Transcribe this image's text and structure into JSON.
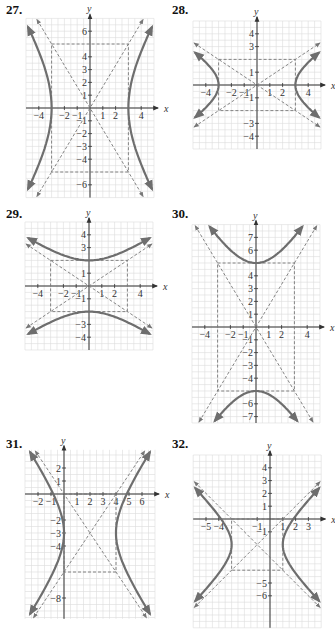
{
  "chart_data": [
    {
      "type": "line",
      "problem": "27.",
      "title": "Hyperbola (horizontal transverse axis)",
      "xlabel": "x",
      "ylabel": "y",
      "center": [
        0,
        0
      ],
      "a": 3,
      "b": 5,
      "orientation": "horizontal",
      "vertices": [
        [
          -3,
          0
        ],
        [
          3,
          0
        ]
      ],
      "asymptotes": [
        "y = 5/3 x",
        "y = -5/3 x"
      ],
      "xlim": [
        -5,
        5
      ],
      "ylim": [
        -7,
        7
      ],
      "xticks": [
        "-4",
        "-2",
        "-1",
        "1",
        "2",
        "4"
      ],
      "yticks": [
        "6",
        "4",
        "3",
        "2",
        "1",
        "-1",
        "-2",
        "-3",
        "-4",
        "-6"
      ],
      "grid": true,
      "frame": {
        "x": 25,
        "y": 20,
        "origin": [
          90,
          108
        ],
        "unit": 12.8,
        "xmin": -5,
        "xmax": 5,
        "ymin": -7,
        "ymax": 7
      }
    },
    {
      "type": "line",
      "problem": "28.",
      "title": "Hyperbola (horizontal transverse axis)",
      "xlabel": "x",
      "ylabel": "y",
      "center": [
        0,
        0
      ],
      "a": 3,
      "b": 2,
      "orientation": "horizontal",
      "vertices": [
        [
          -3,
          0
        ],
        [
          3,
          0
        ]
      ],
      "asymptotes": [
        "y = 2/3 x",
        "y = -2/3 x"
      ],
      "xlim": [
        -5,
        5
      ],
      "ylim": [
        -5,
        5
      ],
      "xticks": [
        "-4",
        "-2",
        "-1",
        "1",
        "2",
        "4"
      ],
      "yticks": [
        "4",
        "3",
        "1",
        "-1",
        "-3",
        "-4"
      ],
      "grid": true,
      "frame": {
        "origin": [
          257,
          85
        ],
        "unit": 12.8,
        "xmin": -5,
        "xmax": 5,
        "ymin": -5,
        "ymax": 5
      }
    },
    {
      "type": "line",
      "problem": "29.",
      "title": "Hyperbola (vertical transverse axis)",
      "xlabel": "x",
      "ylabel": "y",
      "center": [
        0,
        0
      ],
      "a": 2,
      "b": 3,
      "orientation": "vertical",
      "vertices": [
        [
          0,
          -2
        ],
        [
          0,
          2
        ]
      ],
      "asymptotes": [
        "y = 2/3 x",
        "y = -2/3 x"
      ],
      "xlim": [
        -5,
        5
      ],
      "ylim": [
        -5,
        5
      ],
      "xticks": [
        "-4",
        "-2",
        "-1",
        "1",
        "2",
        "4"
      ],
      "yticks": [
        "4",
        "3",
        "1",
        "-1",
        "-3",
        "-4"
      ],
      "grid": true,
      "frame": {
        "origin": [
          89,
          286
        ],
        "unit": 12.8,
        "xmin": -5,
        "xmax": 5,
        "ymin": -5,
        "ymax": 5
      }
    },
    {
      "type": "line",
      "problem": "30.",
      "title": "Hyperbola (vertical transverse axis)",
      "xlabel": "x",
      "ylabel": "y",
      "center": [
        0,
        0
      ],
      "a": 5,
      "b": 3,
      "orientation": "vertical",
      "vertices": [
        [
          0,
          -5
        ],
        [
          0,
          5
        ]
      ],
      "asymptotes": [
        "y = 5/3 x",
        "y = -5/3 x"
      ],
      "xlim": [
        -5,
        5
      ],
      "ylim": [
        -7.5,
        8
      ],
      "xticks": [
        "-4",
        "-2",
        "-1",
        "1",
        "2",
        "4"
      ],
      "yticks": [
        "7",
        "6",
        "4",
        "3",
        "2",
        "1",
        "-1",
        "-2",
        "-3",
        "-4",
        "-6",
        "-7"
      ],
      "grid": true,
      "frame": {
        "origin": [
          256,
          327
        ],
        "unit": 12.8,
        "xmin": -5,
        "xmax": 5,
        "ymin": -7.5,
        "ymax": 8
      }
    },
    {
      "type": "line",
      "problem": "31.",
      "title": "Hyperbola (horizontal transverse axis, shifted)",
      "xlabel": "x",
      "ylabel": "y",
      "center": [
        2,
        -3
      ],
      "a": 2,
      "b": 3,
      "orientation": "horizontal",
      "vertices": [
        [
          0,
          -3
        ],
        [
          4,
          -3
        ]
      ],
      "asymptotes": [
        "y + 3 = 3/2 (x - 2)",
        "y + 3 = -3/2 (x - 2)"
      ],
      "xlim": [
        -3,
        7
      ],
      "ylim": [
        -9.5,
        3
      ],
      "xticks": [
        "-2",
        "-1",
        "1",
        "2",
        "3",
        "4",
        "5",
        "6"
      ],
      "yticks": [
        "2",
        "1",
        "-2",
        "-3",
        "-4",
        "-8"
      ],
      "grid": true,
      "frame": {
        "origin": [
          64,
          494
        ],
        "unit": 13,
        "xmin": -3,
        "xmax": 7,
        "ymin": -9.6,
        "ymax": 3.4
      }
    },
    {
      "type": "line",
      "problem": "32.",
      "title": "Hyperbola (horizontal transverse axis, shifted)",
      "xlabel": "x",
      "ylabel": "y",
      "center": [
        -1,
        -2
      ],
      "a": 2,
      "b": 2,
      "orientation": "horizontal",
      "vertices": [
        [
          -3,
          -2
        ],
        [
          1,
          -2
        ]
      ],
      "asymptotes": [
        "y + 2 = x + 1",
        "y + 2 = -(x + 1)"
      ],
      "xlim": [
        -6,
        4
      ],
      "ylim": [
        -7,
        5
      ],
      "xticks": [
        "-5",
        "-4",
        "-1",
        "1",
        "2",
        "3"
      ],
      "yticks": [
        "4",
        "3",
        "2",
        "1",
        "-1",
        "-5",
        "-6"
      ],
      "grid": true,
      "frame": {
        "origin": [
          270,
          519
        ],
        "unit": 12.8,
        "xmin": -6,
        "xmax": 4,
        "ymin": -8.5,
        "ymax": 5
      }
    }
  ],
  "labels": {
    "p27": "27.",
    "p28": "28.",
    "p29": "29.",
    "p30": "30.",
    "p31": "31.",
    "p32": "32."
  },
  "colors": {
    "curve": "#6e6e6e",
    "dashed": "#777777",
    "grid": "#dcdcdc",
    "axis": "#333333",
    "text": "#111111"
  }
}
